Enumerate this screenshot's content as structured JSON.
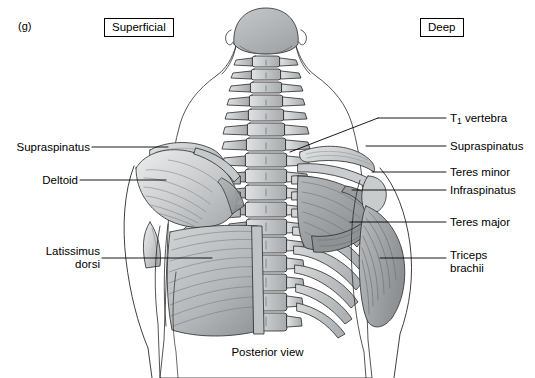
{
  "figure": {
    "letter": "(g)",
    "caption": "Posterior view",
    "view": "Posterior view of the back, shoulder and arm musculature"
  },
  "side_boxes": [
    {
      "label": "Superficial",
      "side": "left"
    },
    {
      "label": "Deep",
      "side": "right"
    }
  ],
  "labels_left": [
    {
      "text": "Supraspinatus",
      "name": "label-supraspinatus-left"
    },
    {
      "text": "Deltoid",
      "name": "label-deltoid"
    },
    {
      "text": "Latissimus\ndorsi",
      "name": "label-latissimus-dorsi"
    }
  ],
  "labels_right": [
    {
      "text": "vertebra",
      "prefix": "T",
      "subscript": "1",
      "name": "label-t1-vertebra"
    },
    {
      "text": "Supraspinatus",
      "name": "label-supraspinatus-right"
    },
    {
      "text": "Teres minor",
      "name": "label-teres-minor"
    },
    {
      "text": "Infraspinatus",
      "name": "label-infraspinatus"
    },
    {
      "text": "Teres major",
      "name": "label-teres-major"
    },
    {
      "text": "Triceps\nbrachii",
      "name": "label-triceps-brachii"
    }
  ],
  "colors": {
    "background": "#ffffff",
    "outline": "#1a1a1a",
    "bone_light": "#d8dadb",
    "bone_mid": "#b9bcbe",
    "bone_dark": "#9a9d9f",
    "muscle_light": "#d3d5d6",
    "muscle_mid": "#a9acae",
    "muscle_dark": "#85888a",
    "skin": "#ffffff",
    "head": "#b2b5b7"
  }
}
